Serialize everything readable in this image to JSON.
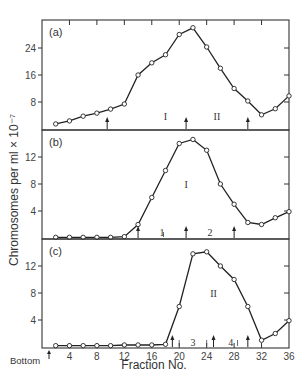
{
  "figure": {
    "ylabel": "Chromosomes per ml × 10⁻⁷",
    "xlabel": "Fraction No.",
    "bottom_label": "Bottom"
  },
  "chart_data": [
    {
      "type": "line",
      "panel": "(a)",
      "x": [
        2,
        4,
        6,
        8,
        10,
        12,
        14,
        16,
        18,
        20,
        22,
        24,
        26,
        28,
        30,
        32,
        34,
        36
      ],
      "values": [
        1.5,
        2.4,
        3.8,
        4.7,
        5.9,
        7.4,
        16,
        19.6,
        22,
        28,
        30,
        24.3,
        18,
        12,
        8.3,
        4.2,
        6,
        9.8
      ],
      "xlabel": "Fraction No.",
      "ylabel": "Chromosomes per ml × 10⁻⁷",
      "yticks": [
        8,
        16,
        24
      ],
      "ylim": [
        0,
        32
      ],
      "xlim": [
        0,
        36
      ],
      "region_labels": [
        {
          "text": "I",
          "x": 18,
          "y": 4
        },
        {
          "text": "II",
          "x": 25.5,
          "y": 4
        }
      ],
      "arrows_x": [
        9.5,
        21,
        30
      ]
    },
    {
      "type": "line",
      "panel": "(b)",
      "x": [
        2,
        4,
        6,
        8,
        10,
        12,
        14,
        16,
        18,
        20,
        22,
        24,
        26,
        28,
        30,
        32,
        34,
        36
      ],
      "values": [
        0.1,
        0.1,
        0.1,
        0.1,
        0.1,
        0.2,
        2,
        6,
        10,
        14,
        14.6,
        13,
        8,
        5,
        2.3,
        2,
        3,
        3.9
      ],
      "yticks": [
        4,
        8,
        12
      ],
      "ylim": [
        0,
        16
      ],
      "xlim": [
        0,
        36
      ],
      "region_labels": [
        {
          "text": "I",
          "x": 21,
          "y": 8
        },
        {
          "text": "1",
          "x": 17.5,
          "y": 0.9
        },
        {
          "text": "2",
          "x": 24.5,
          "y": 0.9
        }
      ],
      "arrows_x": [
        14,
        21,
        28
      ]
    },
    {
      "type": "line",
      "panel": "(c)",
      "x": [
        2,
        4,
        6,
        8,
        10,
        12,
        14,
        16,
        18,
        20,
        22,
        24,
        26,
        28,
        30,
        32,
        34,
        36
      ],
      "values": [
        0.2,
        0.2,
        0.2,
        0.2,
        0.2,
        0.3,
        0.3,
        0.3,
        0.4,
        6,
        13.8,
        14.1,
        12,
        10,
        6,
        1,
        2,
        3.9
      ],
      "yticks": [
        4,
        8,
        12
      ],
      "ylim": [
        0,
        16
      ],
      "xlim": [
        0,
        36
      ],
      "xticks": [
        4,
        8,
        12,
        16,
        20,
        24,
        28,
        32,
        36
      ],
      "region_labels": [
        {
          "text": "II",
          "x": 25,
          "y": 8
        },
        {
          "text": "3",
          "x": 22,
          "y": 0.8
        },
        {
          "text": "4",
          "x": 27.5,
          "y": 0.8
        }
      ],
      "arrows_x": [
        19,
        25,
        30
      ]
    }
  ]
}
